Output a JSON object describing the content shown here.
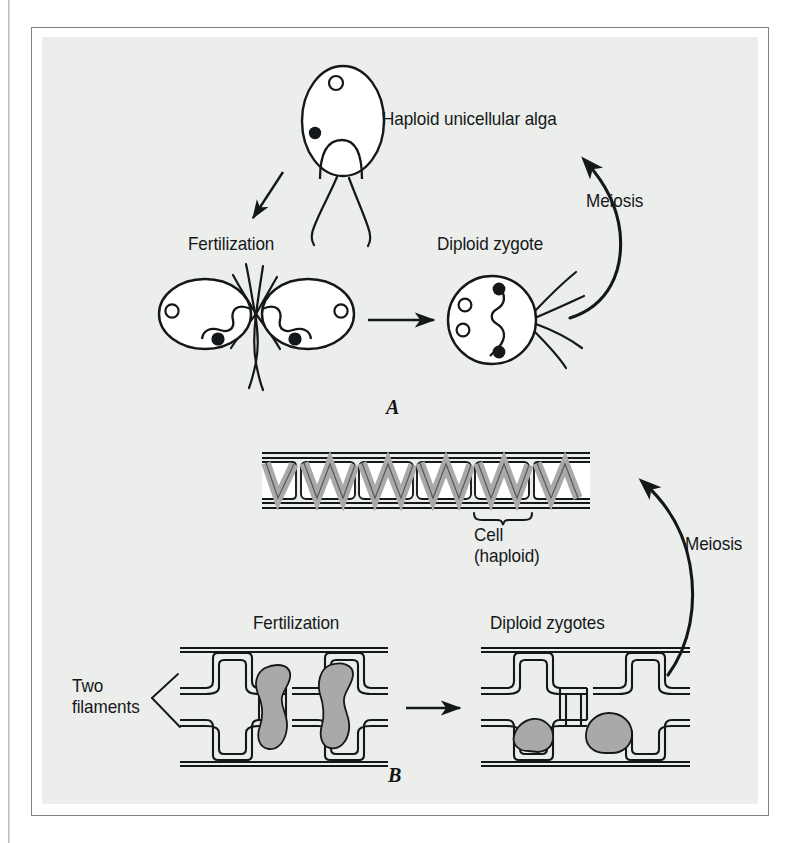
{
  "figure": {
    "kind": "biological-life-cycle-diagram",
    "background_color": "#eceeeb",
    "frame_color": "#7e8486",
    "ink_color": "#15181a",
    "chloroplast_fill": "#a9a9a7",
    "panels": [
      {
        "letter": "A",
        "subject": "Haploid unicellular alga life cycle",
        "stages": [
          {
            "name": "haploid-unicellular-alga",
            "label": "Haploid unicellular alga"
          },
          {
            "name": "fertilization",
            "label": "Fertilization"
          },
          {
            "name": "diploid-zygote",
            "label": "Diploid zygote"
          },
          {
            "name": "meiosis",
            "label": "Meiosis"
          }
        ]
      },
      {
        "letter": "B",
        "subject": "Filamentous alga life cycle",
        "stages": [
          {
            "name": "haploid-filament-cell",
            "label_line1": "Cell",
            "label_line2": "(haploid)"
          },
          {
            "name": "two-filaments",
            "label_line1": "Two",
            "label_line2": "filaments"
          },
          {
            "name": "fertilization",
            "label": "Fertilization"
          },
          {
            "name": "diploid-zygotes",
            "label": "Diploid zygotes"
          },
          {
            "name": "meiosis",
            "label": "Meiosis"
          }
        ]
      }
    ]
  },
  "panel_a": {
    "alga_label": "Haploid unicellular alga",
    "meiosis_label": "Meiosis",
    "fertilization_label": "Fertilization",
    "zygote_label": "Diploid zygote",
    "letter": "A"
  },
  "panel_b": {
    "cell_label_line1": "Cell",
    "cell_label_line2": "(haploid)",
    "meiosis_label": "Meiosis",
    "fertilization_label": "Fertilization",
    "zygotes_label": "Diploid zygotes",
    "two_filaments_line1": "Two",
    "two_filaments_line2": "filaments",
    "letter": "B"
  }
}
